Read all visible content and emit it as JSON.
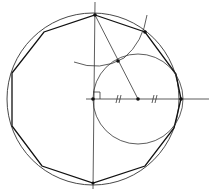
{
  "diagram": {
    "canvas": {
      "width": 209,
      "height": 190,
      "background": "#ffffff"
    },
    "stroke_color": "#1a1a1a",
    "main_circle": {
      "cx": 93,
      "cy": 99,
      "r": 86
    },
    "small_circle": {
      "cx": 138,
      "cy": 99,
      "r": 45
    },
    "construction_arc": {
      "center": "top-vertex",
      "cx": 95,
      "cy": 15,
      "r": 52
    },
    "right_angle_marker": {
      "x": 93,
      "y": 99,
      "size": 6
    },
    "equal_segment_marks": [
      "//",
      "//"
    ],
    "points": [
      {
        "name": "center",
        "x": 93,
        "y": 99
      },
      {
        "name": "midpoint",
        "x": 138,
        "y": 99
      },
      {
        "name": "right-end",
        "x": 180,
        "y": 99
      },
      {
        "name": "top-vertex",
        "x": 95,
        "y": 15
      },
      {
        "name": "intersection",
        "x": 118,
        "y": 61
      },
      {
        "name": "second-vertex",
        "x": 145,
        "y": 32
      }
    ],
    "polygon": {
      "sides": 10,
      "label": "regular decagon"
    }
  }
}
